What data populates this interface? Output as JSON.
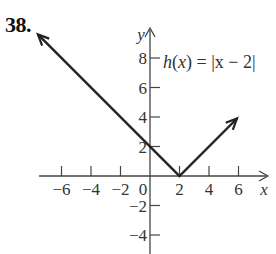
{
  "problem_number": "38.",
  "chart_data": {
    "type": "line",
    "title": "",
    "function_label": "h(x) = |x − 2|",
    "function_label_parts": {
      "name": "h",
      "var": "x",
      "rest": ") = |x − 2|"
    },
    "xlabel": "x",
    "ylabel": "y",
    "xlim": [
      -7.5,
      8
    ],
    "ylim": [
      -5,
      9.5
    ],
    "grid": false,
    "x_ticks": [
      -6,
      -4,
      -2,
      2,
      4,
      6
    ],
    "x_tick_labels": [
      "−6",
      "−4",
      "−2",
      "2",
      "4",
      "6"
    ],
    "y_ticks": [
      8,
      6,
      4,
      2,
      -2,
      -4
    ],
    "y_tick_labels": [
      "8",
      "6",
      "4",
      "2",
      "−2",
      "−4"
    ],
    "origin_label": "0",
    "series": [
      {
        "name": "h(x) = |x − 2|",
        "x": [
          -7.6,
          2,
          5.9
        ],
        "y": [
          9.6,
          0,
          3.9
        ],
        "arrows": "both",
        "color": "#222222"
      }
    ],
    "annotations": [
      {
        "text": "h(x) = |x − 2|",
        "x": 2.5,
        "y": 8
      }
    ]
  }
}
